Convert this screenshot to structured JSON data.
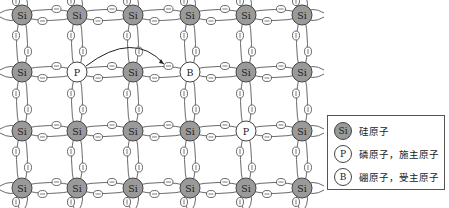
{
  "diagram": {
    "title": "",
    "lattice": {
      "columns_x": [
        22,
        77,
        133,
        190,
        246,
        302
      ],
      "rows_y": [
        15,
        72,
        131,
        188
      ],
      "atoms": [
        [
          "Si",
          "Si",
          "Si",
          "Si",
          "Si",
          "Si"
        ],
        [
          "Si",
          "P",
          "Si",
          "B",
          "Si",
          "Si"
        ],
        [
          "Si",
          "Si",
          "Si",
          "Si",
          "P",
          "Si"
        ],
        [
          "Si",
          "Si",
          "Si",
          "Si",
          "Si",
          "Si"
        ]
      ],
      "electron_symbol": "⊖",
      "arrow": {
        "from": "P(row 1, col 1)",
        "to": "electron near B(row 1, col 3)"
      }
    },
    "colors": {
      "silicon_fill": "#9a9a9a",
      "impurity_fill": "#ffffff",
      "stroke": "#444444"
    }
  },
  "legend": {
    "items": [
      {
        "symbol": "Si",
        "style": "filled",
        "label": "硅原子"
      },
      {
        "symbol": "P",
        "style": "white",
        "label": "磷原子，施主原子"
      },
      {
        "symbol": "B",
        "style": "white",
        "label": "硼原子，受主原子"
      }
    ]
  }
}
